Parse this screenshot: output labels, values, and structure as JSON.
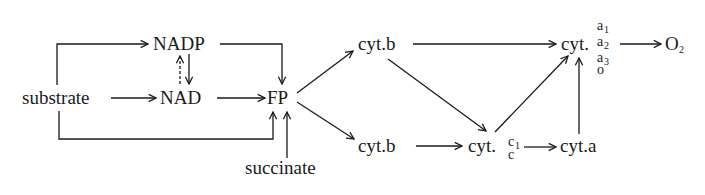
{
  "diagram": {
    "type": "respiratory-electron-transport-pathway",
    "nodes": {
      "substrate": "substrate",
      "nadp": "NADP",
      "nad": "NAD",
      "fp": "FP",
      "succinate": "succinate",
      "cyt_b_top": "cyt.b",
      "cyt_b_bottom": "cyt.b",
      "cyt_c_prefix": "cyt.",
      "cyt_c_sup": "c",
      "cyt_c_sup_sub": "1",
      "cyt_c_low": "c",
      "cyt_a": "cyt.a",
      "cyt_oxidase_prefix": "cyt.",
      "cyt_oxidase_a": "a",
      "cyt_oxidase_1": "1",
      "cyt_oxidase_2": "2",
      "cyt_oxidase_3": "3",
      "cyt_oxidase_o": "o",
      "o2_base": "O",
      "o2_sub": "2"
    },
    "edges": [
      {
        "from": "substrate",
        "to": "NADP",
        "style": "solid"
      },
      {
        "from": "substrate",
        "to": "NAD",
        "style": "solid"
      },
      {
        "from": "substrate",
        "to": "FP",
        "style": "solid"
      },
      {
        "from": "NADP",
        "to": "NAD",
        "style": "solid"
      },
      {
        "from": "NAD",
        "to": "NADP",
        "style": "dashed"
      },
      {
        "from": "NADP",
        "to": "FP",
        "style": "solid"
      },
      {
        "from": "NAD",
        "to": "FP",
        "style": "solid"
      },
      {
        "from": "succinate",
        "to": "FP",
        "style": "solid"
      },
      {
        "from": "FP",
        "to": "cyt.b (upper)",
        "style": "solid"
      },
      {
        "from": "FP",
        "to": "cyt.b (lower)",
        "style": "solid"
      },
      {
        "from": "cyt.b (upper)",
        "to": "cyt.a1/a2/a3/o",
        "style": "solid"
      },
      {
        "from": "cyt.b (upper)",
        "to": "cyt.c1/c",
        "style": "solid"
      },
      {
        "from": "cyt.b (lower)",
        "to": "cyt.c1/c",
        "style": "solid"
      },
      {
        "from": "cyt.c1/c",
        "to": "cyt.a1/a2/a3/o",
        "style": "solid"
      },
      {
        "from": "cyt.c1/c",
        "to": "cyt.a",
        "style": "solid"
      },
      {
        "from": "cyt.a",
        "to": "cyt.a1/a2/a3/o",
        "style": "solid"
      },
      {
        "from": "cyt.a1/a2/a3/o",
        "to": "O2",
        "style": "solid"
      }
    ]
  }
}
